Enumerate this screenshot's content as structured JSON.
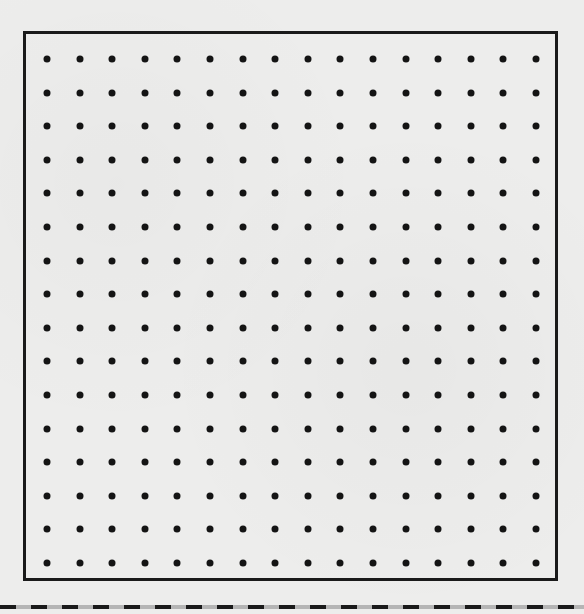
{
  "worksheet": {
    "type": "dot-grid",
    "border_color": "#1a1a1a",
    "dot_color": "#141414",
    "background_color": "#ededec",
    "grid": {
      "columns": 16,
      "rows": 16,
      "x_start": 47,
      "x_end": 536,
      "y_start": 59,
      "y_end": 563
    },
    "cut_line": {
      "style": "dashed",
      "y": 607
    }
  }
}
